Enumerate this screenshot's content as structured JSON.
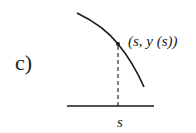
{
  "figure": {
    "panel_label": "c)",
    "point_label": "(s, y (s))",
    "axis_tick_label": "s",
    "colors": {
      "stroke": "#1a1a1a",
      "background": "#ffffff"
    }
  }
}
